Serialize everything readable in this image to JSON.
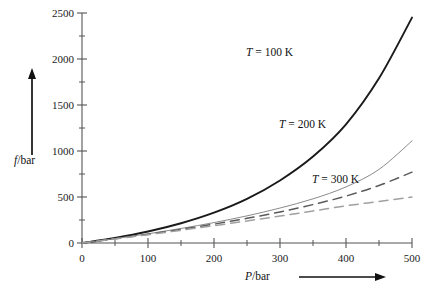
{
  "chart_data": {
    "type": "line",
    "title": "",
    "xlabel": "P/bar",
    "ylabel": "f/bar",
    "xlim": [
      0,
      500
    ],
    "ylim": [
      0,
      2500
    ],
    "grid": false,
    "legend_position": "inline-annotations",
    "x_ticks_major": [
      0,
      100,
      200,
      300,
      400,
      500
    ],
    "x_ticks_minor": [
      50,
      150,
      250,
      350,
      450
    ],
    "y_ticks_major": [
      0,
      500,
      1000,
      1500,
      2000,
      2500
    ],
    "y_ticks_minor": [
      250,
      750,
      1250,
      1750,
      2250
    ],
    "x": [
      0,
      50,
      100,
      150,
      200,
      250,
      300,
      350,
      400,
      450,
      500
    ],
    "series": [
      {
        "name": "T = 100 K",
        "style": "solid",
        "color": "#1a1a1a",
        "width": 1.9,
        "values": [
          0,
          55,
          125,
          215,
          330,
          480,
          680,
          940,
          1290,
          1790,
          2450
        ]
      },
      {
        "name": "T = 200 K",
        "style": "solid",
        "color": "#8a8a8a",
        "width": 1.0,
        "values": [
          0,
          48,
          100,
          158,
          222,
          295,
          380,
          480,
          610,
          800,
          1110
        ]
      },
      {
        "name": "T = 300 K upper",
        "style": "dashed",
        "color": "#5a5a5a",
        "width": 1.5,
        "values": [
          0,
          46,
          95,
          148,
          205,
          268,
          338,
          418,
          510,
          625,
          770
        ]
      },
      {
        "name": "T = 300 K lower",
        "style": "dashed",
        "color": "#a0a0a0",
        "width": 1.5,
        "values": [
          0,
          44,
          90,
          138,
          188,
          240,
          293,
          348,
          404,
          452,
          500
        ]
      }
    ],
    "annotations": [
      {
        "text_prefix": "T",
        "text_suffix": " = 100 K",
        "x": 300,
        "y": 2070
      },
      {
        "text_prefix": "T",
        "text_suffix": " = 200 K",
        "x": 350,
        "y": 1280
      },
      {
        "text_prefix": "T",
        "text_suffix": " = 300 K",
        "x": 400,
        "y": 690
      }
    ]
  },
  "axis": {
    "y_label_prefix": "f",
    "y_label_suffix": "/bar",
    "x_label_prefix": "P",
    "x_label_suffix": "/bar"
  },
  "ticks": {
    "y": [
      "2500",
      "2000",
      "1500",
      "1000",
      "500",
      "0"
    ],
    "x": [
      "0",
      "100",
      "200",
      "300",
      "400",
      "500"
    ]
  },
  "labels": {
    "curve_100k_prefix": "T",
    "curve_100k_suffix": " = 100 K",
    "curve_200k_prefix": "T",
    "curve_200k_suffix": " = 200 K",
    "curve_300k_prefix": "T",
    "curve_300k_suffix": " = 300 K"
  }
}
